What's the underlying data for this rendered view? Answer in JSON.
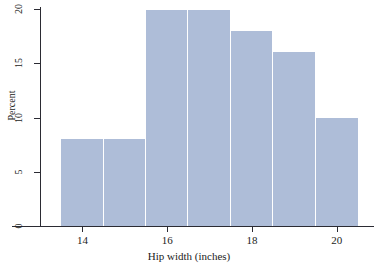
{
  "figure": {
    "width": 378,
    "height": 268,
    "background": "#ffffff",
    "bar_color": "#aebdd8",
    "axis_color": "#2b2b33",
    "text_color": "#1c1c22"
  },
  "chart_data": {
    "type": "bar",
    "title": "",
    "xlabel": "Hip width (inches)",
    "ylabel": "Percent",
    "xlim": [
      13.0,
      20.9
    ],
    "ylim": [
      0,
      20
    ],
    "grid": false,
    "legend": null,
    "bin_width": 1,
    "bin_edges": [
      13.5,
      14.5,
      15.5,
      16.5,
      17.5,
      18.5,
      19.5,
      20.5
    ],
    "categories": [
      "13.5-14.5",
      "14.5-15.5",
      "15.5-16.5",
      "16.5-17.5",
      "17.5-18.5",
      "18.5-19.5",
      "19.5-20.5"
    ],
    "values": [
      8,
      8,
      19.9,
      19.9,
      18,
      16,
      10
    ],
    "xticks": [
      14,
      16,
      18,
      20
    ],
    "xtick_labels": [
      "14",
      "16",
      "18",
      "20"
    ],
    "yticks": [
      0,
      5,
      10,
      15,
      20
    ],
    "ytick_labels": [
      "0",
      "5",
      "10",
      "15",
      "20"
    ]
  }
}
